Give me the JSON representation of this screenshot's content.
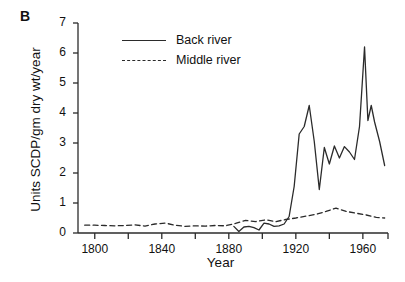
{
  "panel": {
    "label": "B"
  },
  "axes": {
    "ylabel": "Units SCDP/gm dry wt/year",
    "xlabel": "Year",
    "yticks": [
      "0",
      "1",
      "2",
      "3",
      "4",
      "5",
      "6",
      "7"
    ],
    "xticks": [
      "1800",
      "1840",
      "1880",
      "1920",
      "1960"
    ]
  },
  "legend": {
    "items": [
      {
        "label": "Back river",
        "style": "solid",
        "color": "#2b2b2b"
      },
      {
        "label": "Middle river",
        "style": "dashed",
        "color": "#2b2b2b"
      }
    ]
  },
  "chart_data": {
    "type": "line",
    "title": "",
    "xlabel": "Year",
    "ylabel": "Units SCDP/gm dry wt/year",
    "xlim": [
      1790,
      1975
    ],
    "ylim": [
      0,
      7
    ],
    "grid": false,
    "legend_position": "top-center",
    "xticks": [
      1800,
      1840,
      1880,
      1920,
      1960
    ],
    "xticks_minor": [
      1820,
      1860,
      1900,
      1940
    ],
    "yticks": [
      0,
      1,
      2,
      3,
      4,
      5,
      6,
      7
    ],
    "series": [
      {
        "name": "Back river",
        "style": "solid",
        "color": "#2b2b2b",
        "x": [
          1883,
          1886,
          1889,
          1892,
          1895,
          1898,
          1901,
          1904,
          1907,
          1910,
          1913,
          1916,
          1919,
          1922,
          1925,
          1928,
          1931,
          1934,
          1937,
          1940,
          1943,
          1946,
          1949,
          1952,
          1955,
          1958,
          1961,
          1963,
          1965,
          1967,
          1970,
          1973
        ],
        "y": [
          0.22,
          0.05,
          0.2,
          0.22,
          0.18,
          0.1,
          0.33,
          0.3,
          0.22,
          0.24,
          0.3,
          0.55,
          1.55,
          3.3,
          3.55,
          4.25,
          3.05,
          1.45,
          2.85,
          2.3,
          2.9,
          2.5,
          2.88,
          2.7,
          2.45,
          3.55,
          6.2,
          3.75,
          4.25,
          3.7,
          3.05,
          2.25
        ]
      },
      {
        "name": "Middle river",
        "style": "dashed",
        "color": "#2b2b2b",
        "x": [
          1794,
          1800,
          1806,
          1812,
          1818,
          1824,
          1830,
          1836,
          1842,
          1848,
          1854,
          1860,
          1866,
          1872,
          1878,
          1884,
          1890,
          1896,
          1902,
          1908,
          1914,
          1920,
          1926,
          1932,
          1938,
          1944,
          1950,
          1956,
          1962,
          1968,
          1973
        ],
        "y": [
          0.26,
          0.26,
          0.25,
          0.24,
          0.25,
          0.27,
          0.23,
          0.3,
          0.33,
          0.26,
          0.22,
          0.24,
          0.23,
          0.25,
          0.24,
          0.32,
          0.42,
          0.38,
          0.44,
          0.38,
          0.45,
          0.5,
          0.56,
          0.62,
          0.72,
          0.83,
          0.72,
          0.66,
          0.6,
          0.52,
          0.5
        ]
      }
    ]
  }
}
